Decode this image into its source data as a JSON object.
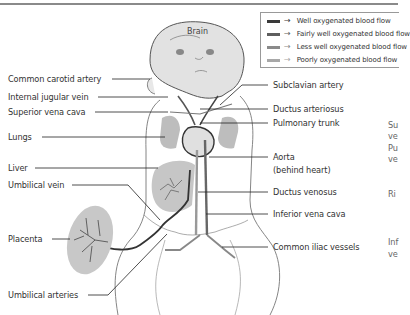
{
  "legend": {
    "items": [
      {
        "label": "Well oxygenated blood flow",
        "color": "#3a3a3a"
      },
      {
        "label": "Fairly well oxygenated blood flow",
        "color": "#5e5e5e"
      },
      {
        "label": "Less well oxygenated blood flow",
        "color": "#8a8a8a"
      },
      {
        "label": "Poorly oxygenated blood flow",
        "color": "#a8a8a8"
      }
    ],
    "arrow": "→"
  },
  "diagram": {
    "title_region": "Brain",
    "left_labels": [
      "Common carotid artery",
      "Internal jugular vein",
      "Superior vena cava",
      "Lungs",
      "Liver",
      "Umbilical vein",
      "Placenta",
      "Umbilical arteries"
    ],
    "right_labels": [
      "Subclavian artery",
      "Ductus arteriosus",
      "Pulmonary trunk",
      "Aorta",
      "(behind heart)",
      "Ductus venosus",
      "Inferior vena cava",
      "Common iliac vessels"
    ],
    "cut_off_labels": [
      "Su",
      "ve",
      "Pu",
      "ve",
      "Ri",
      "Inf",
      "ve"
    ]
  }
}
